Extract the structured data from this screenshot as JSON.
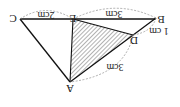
{
  "diagram": {
    "rotation_deg": 180,
    "vertices": {
      "A": {
        "label": "A",
        "x": 70,
        "y": 82
      },
      "B": {
        "label": "B",
        "x": 156,
        "y": 18
      },
      "C": {
        "label": "C",
        "x": 20,
        "y": 19
      },
      "D": {
        "label": "D",
        "x": 133,
        "y": 35
      },
      "E": {
        "label": "E",
        "x": 73,
        "y": 19
      }
    },
    "segments": [
      {
        "from": "A",
        "to": "B"
      },
      {
        "from": "B",
        "to": "C"
      },
      {
        "from": "C",
        "to": "A"
      },
      {
        "from": "A",
        "to": "E"
      },
      {
        "from": "E",
        "to": "D"
      }
    ],
    "shaded_region": [
      "A",
      "E",
      "D"
    ],
    "measurements": {
      "CE": "2cm",
      "EB": "3cm",
      "BD": "1 cm",
      "DA": "3cm"
    },
    "colors": {
      "line": "#111111",
      "hatch": "#555555",
      "dashed": "#999999"
    }
  }
}
